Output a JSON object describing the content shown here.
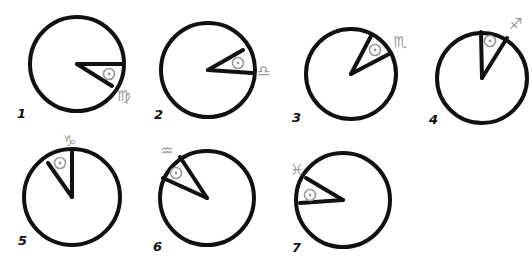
{
  "diagram": {
    "panels": [
      {
        "label": "1",
        "sign": "♍",
        "sign_name": "Virgo",
        "cx": 77,
        "cy": 64,
        "r": 47,
        "hand_a": [
          123,
          64
        ],
        "hand_b": [
          112,
          86
        ],
        "sun": [
          109,
          74
        ],
        "glyph_pos": [
          117,
          89
        ],
        "label_pos": [
          17,
          107
        ]
      },
      {
        "label": "2",
        "sign": "♎",
        "sign_name": "Libra",
        "cx": 208,
        "cy": 70,
        "r": 47,
        "hand_a": [
          252,
          73
        ],
        "hand_b": [
          243,
          50
        ],
        "sun": [
          238,
          63
        ],
        "glyph_pos": [
          257,
          64
        ],
        "label_pos": [
          154,
          108
        ]
      },
      {
        "label": "3",
        "sign": "♏",
        "sign_name": "Scorpio",
        "cx": 351,
        "cy": 74,
        "r": 45,
        "hand_a": [
          371,
          36
        ],
        "hand_b": [
          391,
          53
        ],
        "sun": [
          375,
          50
        ],
        "glyph_pos": [
          393,
          35
        ],
        "label_pos": [
          292,
          111
        ]
      },
      {
        "label": "4",
        "sign": "♐",
        "sign_name": "Sagittarius",
        "cx": 482,
        "cy": 78,
        "r": 45,
        "hand_a": [
          481,
          32
        ],
        "hand_b": [
          507,
          38
        ],
        "sun": [
          490,
          41
        ],
        "glyph_pos": [
          509,
          17
        ],
        "label_pos": [
          429,
          113
        ]
      },
      {
        "label": "5",
        "sign": "♑",
        "sign_name": "Capricorn",
        "cx": 72,
        "cy": 197,
        "r": 48,
        "hand_a": [
          72,
          152
        ],
        "hand_b": [
          48,
          163
        ],
        "sun": [
          60,
          163
        ],
        "glyph_pos": [
          63,
          134
        ],
        "label_pos": [
          18,
          234
        ]
      },
      {
        "label": "6",
        "sign": "♒",
        "sign_name": "Aquarius",
        "cx": 207,
        "cy": 198,
        "r": 47,
        "hand_a": [
          163,
          178
        ],
        "hand_b": [
          180,
          157
        ],
        "sun": [
          176,
          173
        ],
        "glyph_pos": [
          160,
          144
        ],
        "label_pos": [
          153,
          240
        ]
      },
      {
        "label": "7",
        "sign": "♓",
        "sign_name": "Pisces",
        "cx": 343,
        "cy": 200,
        "r": 47,
        "hand_a": [
          300,
          203
        ],
        "hand_b": [
          306,
          178
        ],
        "sun": [
          310,
          195
        ],
        "glyph_pos": [
          290,
          163
        ],
        "label_pos": [
          292,
          241
        ]
      }
    ],
    "colors": {
      "ink": "#111111",
      "symbol_gray": "#9a9a9a",
      "background": "#ffffff"
    }
  }
}
